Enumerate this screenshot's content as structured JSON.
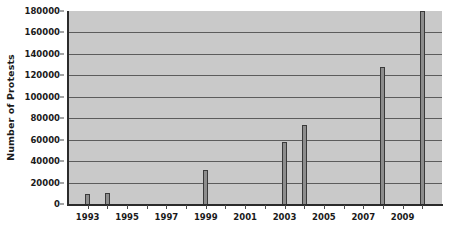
{
  "chart_data": {
    "type": "bar",
    "title": "",
    "xlabel": "",
    "ylabel": "Number of Protests",
    "ylim": [
      0,
      180000
    ],
    "ytick_step": 20000,
    "yticks": [
      0,
      20000,
      40000,
      60000,
      80000,
      100000,
      120000,
      140000,
      160000,
      180000
    ],
    "ytick_labels": [
      "0",
      "20000",
      "40000",
      "60000",
      "80000",
      "100000",
      "120000",
      "140000",
      "160000",
      "180000"
    ],
    "xlim": [
      1992,
      2011
    ],
    "xticks": [
      1993,
      1995,
      1997,
      1999,
      2001,
      2003,
      2005,
      2007,
      2009
    ],
    "xtick_labels": [
      "1993",
      "1995",
      "1997",
      "1999",
      "2001",
      "2003",
      "2005",
      "2007",
      "2009"
    ],
    "categories": [
      1993,
      1994,
      1995,
      1996,
      1997,
      1998,
      1999,
      2000,
      2001,
      2002,
      2003,
      2004,
      2005,
      2006,
      2007,
      2008,
      2009,
      2010
    ],
    "values": [
      9000,
      10500,
      0,
      0,
      0,
      0,
      32000,
      0,
      0,
      0,
      58000,
      74000,
      0,
      0,
      0,
      128000,
      0,
      185000
    ],
    "grid": true,
    "grid_axis": "y",
    "legend": "none",
    "colors": {
      "plot_background": "#c9c9c9",
      "bar_fill": "#8d8d8d",
      "bar_outline": "#3a3a3a",
      "gridline": "#5c5c5c",
      "axis": "#2b2b2b",
      "text": "#1a1a1a",
      "figure_background": "#ffffff"
    }
  }
}
